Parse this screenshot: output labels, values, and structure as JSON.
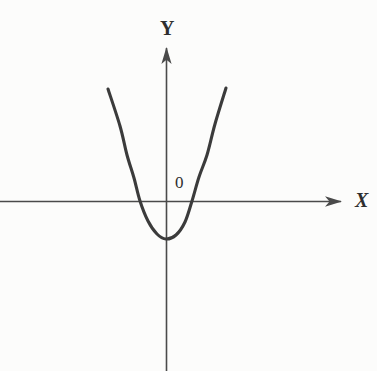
{
  "figure": {
    "background_color": "#fcfcfb",
    "width": 377,
    "height": 371,
    "axis_color": "#4a4a4a",
    "curve_color": "#3b3b3b",
    "label_color": "#2e2e2e"
  },
  "labels": {
    "y_axis": "Y",
    "x_axis": "X",
    "origin": "0"
  },
  "chart_data": {
    "type": "line",
    "title": "",
    "subtitle": "",
    "xlabel": "X",
    "ylabel": "Y",
    "origin_label": "0",
    "grid": false,
    "legend": "none",
    "annotations": [
      {
        "text": "Y",
        "role": "y-axis-label",
        "px": [
          163,
          28
        ]
      },
      {
        "text": "X",
        "role": "x-axis-label",
        "px": [
          358,
          200
        ]
      },
      {
        "text": "0",
        "role": "origin-label",
        "px": [
          180,
          184
        ]
      }
    ],
    "axes": {
      "origin_px": [
        166.5,
        201.5
      ],
      "x_axis_px": {
        "from": [
          0,
          201.5
        ],
        "to": [
          342,
          201.5
        ],
        "arrow_at": "right"
      },
      "y_axis_px": {
        "from": [
          166.5,
          371
        ],
        "to": [
          166.5,
          47
        ],
        "arrow_at": "top"
      },
      "x_units_per_px": 0.04,
      "y_units_per_px": 0.04,
      "xlim": [
        -6.7,
        8.4
      ],
      "ylim": [
        -6.8,
        6.2
      ]
    },
    "series": [
      {
        "name": "parabola",
        "equation": "y = a(x - h)^2 + k",
        "vertex_px": [
          166,
          239
        ],
        "vertex_units": [
          -0.02,
          -1.5
        ],
        "x_intercepts_px": [
          140,
          192
        ],
        "x_intercepts_units": [
          -1.06,
          1.02
        ],
        "endpoints_px": [
          [
            108,
            89
          ],
          [
            226,
            88
          ]
        ],
        "curve_points_px": [
          [
            108,
            89
          ],
          [
            120,
            126
          ],
          [
            127,
            155
          ],
          [
            134,
            178
          ],
          [
            140,
            201
          ],
          [
            148,
            221
          ],
          [
            157,
            234
          ],
          [
            166,
            239
          ],
          [
            176,
            235
          ],
          [
            185,
            222
          ],
          [
            192,
            201
          ],
          [
            199,
            177
          ],
          [
            207,
            155
          ],
          [
            215,
            124
          ],
          [
            226,
            88
          ]
        ],
        "opens": "up",
        "stroke_width_px": 3.1
      }
    ]
  }
}
